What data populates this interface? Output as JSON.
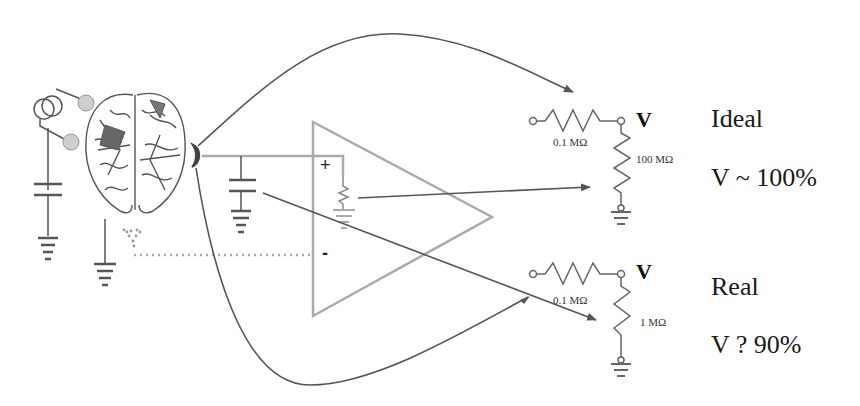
{
  "diagram": {
    "components": {
      "electrode_source": "current-source-icon",
      "brain": "brain-icon",
      "electrode_contact": "electrode-icon",
      "amplifier": "op-amp-triangle",
      "capacitor": "capacitor-icon",
      "ground": "ground-icon"
    },
    "amplifier": {
      "plus_label": "+",
      "minus_label": "-"
    },
    "ideal": {
      "series_resistor": "0.1 MΩ",
      "load_resistor": "100 MΩ",
      "node_label": "V",
      "title": "Ideal",
      "result": "V ~ 100%"
    },
    "real": {
      "series_resistor": "0.1 MΩ",
      "load_resistor": "1 MΩ",
      "node_label": "V",
      "title": "Real",
      "result": "V ?  90%"
    },
    "colors": {
      "line_dark": "#555555",
      "line_light": "#aaaaaa",
      "electrode_fill": "#cccccc",
      "text": "#222222"
    }
  }
}
